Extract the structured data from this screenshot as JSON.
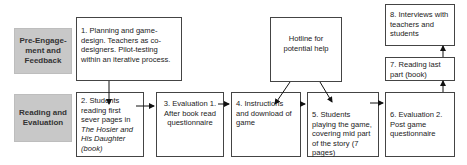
{
  "rows": {
    "pre": "Pre-Engage-ment and Feedback",
    "reading": "Reading and Evaluation"
  },
  "boxes": {
    "b1": "1. Planning and game-design. Teachers as co-designers. Pilot-testing within an iterative process.",
    "b2a": "2. Students reading first sever pages in ",
    "b2b": "The Hosier and His Daughter",
    "b2c": " (book)",
    "b3": "3. Evaluation 1. After book read questionnaire",
    "b4": "4. Instructions and download of game",
    "hotline": "Hotline for potential help",
    "b5": "5. Students playing the game, covering mid part of the story (7 pages)",
    "b6": "6. Evaluation 2. Post game questionnaire",
    "b7": "7. Reading last part (book)",
    "b8": "8. Interviews with teachers and students"
  }
}
